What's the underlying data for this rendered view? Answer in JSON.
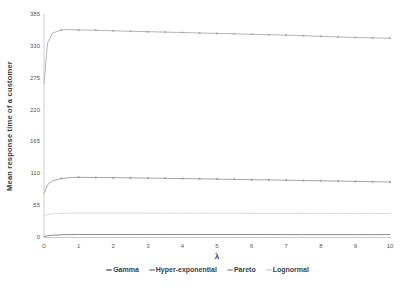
{
  "figure": {
    "background": "#ffffff",
    "axis_color": "#c2c2c2",
    "tick_text_color": "#595959"
  },
  "chart_data": {
    "type": "line",
    "title": "",
    "xlabel": "λ",
    "ylabel": "Mean response time of a customer",
    "xlim": [
      0,
      10
    ],
    "ylim": [
      0,
      385
    ],
    "x_ticks": [
      0,
      1,
      2,
      3,
      4,
      5,
      6,
      7,
      8,
      9,
      10
    ],
    "y_ticks": [
      0,
      55,
      110,
      165,
      220,
      275,
      330,
      385
    ],
    "grid": false,
    "legend_position": "bottom-center",
    "x": [
      0,
      0.1,
      0.25,
      0.5,
      0.75,
      1,
      1.5,
      2,
      2.5,
      3,
      3.5,
      4,
      4.5,
      5,
      5.5,
      6,
      6.5,
      7,
      7.5,
      8,
      8.5,
      9,
      9.5,
      10
    ],
    "series": [
      {
        "name": "Gamma",
        "color": "#8d8d91",
        "marker": "none",
        "marker_color": "#8d8d91",
        "values": [
          1,
          2,
          3,
          3.8,
          4.1,
          4.3,
          4.4,
          4.4,
          4.4,
          4.4,
          4.4,
          4.4,
          4.3,
          4.3,
          4.3,
          4.3,
          4.3,
          4.2,
          4.2,
          4.2,
          4.2,
          4.2,
          4.2,
          4.2
        ]
      },
      {
        "name": "Hyper-exponential",
        "color": "#a6a6aa",
        "marker": "dot",
        "marker_color": "#97979c",
        "values": [
          75,
          90,
          97,
          101,
          102.5,
          103,
          102.8,
          102.5,
          102.1,
          101.7,
          101.3,
          100.9,
          100.4,
          100,
          99.5,
          99,
          98.5,
          98,
          97.5,
          97,
          96.5,
          96,
          95.5,
          95
        ]
      },
      {
        "name": "Pareto",
        "color": "#b5b5b9",
        "marker": "dot",
        "marker_color": "#a5a5ab",
        "values": [
          265,
          335,
          352,
          357.5,
          358,
          357.5,
          356.8,
          356,
          355.2,
          354.5,
          353.8,
          353,
          352.2,
          351.5,
          350.8,
          350,
          349.2,
          348.5,
          347.5,
          346.5,
          345.5,
          344.5,
          343.8,
          343
        ]
      },
      {
        "name": "Lognormal",
        "color": "#dadadc",
        "marker": "none",
        "marker_color": "#dadadc",
        "values": [
          36,
          38.5,
          40,
          41,
          41.3,
          41.5,
          41.5,
          41.4,
          41.4,
          41.3,
          41.3,
          41.2,
          41.2,
          41.1,
          41.1,
          41,
          41,
          40.9,
          40.9,
          40.8,
          40.8,
          40.7,
          40.7,
          40.6
        ]
      }
    ]
  }
}
